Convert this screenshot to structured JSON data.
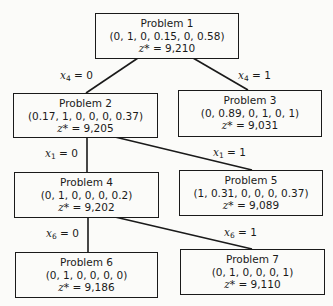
{
  "diagram": {
    "type": "branch-and-bound tree",
    "nodes": [
      {
        "id": "p1",
        "title": "Problem 1",
        "solution": "(0, 1, 0, 0.15, 0, 0.58)",
        "z_label": "z*",
        "z_value": "= 9,210"
      },
      {
        "id": "p2",
        "title": "Problem 2",
        "solution": "(0.17, 1, 0, 0, 0, 0.37)",
        "z_label": "z*",
        "z_value": "= 9,205"
      },
      {
        "id": "p3",
        "title": "Problem 3",
        "solution": "(0, 0.89, 0, 1, 0, 1)",
        "z_label": "z*",
        "z_value": "= 9,031"
      },
      {
        "id": "p4",
        "title": "Problem 4",
        "solution": "(0, 1, 0, 0, 0, 0.2)",
        "z_label": "z*",
        "z_value": "= 9,202"
      },
      {
        "id": "p5",
        "title": "Problem 5",
        "solution": "(1, 0.31, 0, 0, 0, 0.37)",
        "z_label": "z*",
        "z_value": "= 9,089"
      },
      {
        "id": "p6",
        "title": "Problem 6",
        "solution": "(0, 1, 0, 0, 0, 0)",
        "z_label": "z*",
        "z_value": "= 9,186"
      },
      {
        "id": "p7",
        "title": "Problem 7",
        "solution": "(0, 1, 0, 0, 0, 1)",
        "z_label": "z*",
        "z_value": "= 9,110"
      }
    ],
    "edges": [
      {
        "from": "p1",
        "to": "p2",
        "var": "x",
        "sub": "4",
        "cond": "= 0"
      },
      {
        "from": "p1",
        "to": "p3",
        "var": "x",
        "sub": "4",
        "cond": "= 1"
      },
      {
        "from": "p2",
        "to": "p4",
        "var": "x",
        "sub": "1",
        "cond": "= 0"
      },
      {
        "from": "p2",
        "to": "p5",
        "var": "x",
        "sub": "1",
        "cond": "= 1"
      },
      {
        "from": "p4",
        "to": "p6",
        "var": "x",
        "sub": "6",
        "cond": "= 0"
      },
      {
        "from": "p4",
        "to": "p7",
        "var": "x",
        "sub": "6",
        "cond": "= 1"
      }
    ]
  }
}
